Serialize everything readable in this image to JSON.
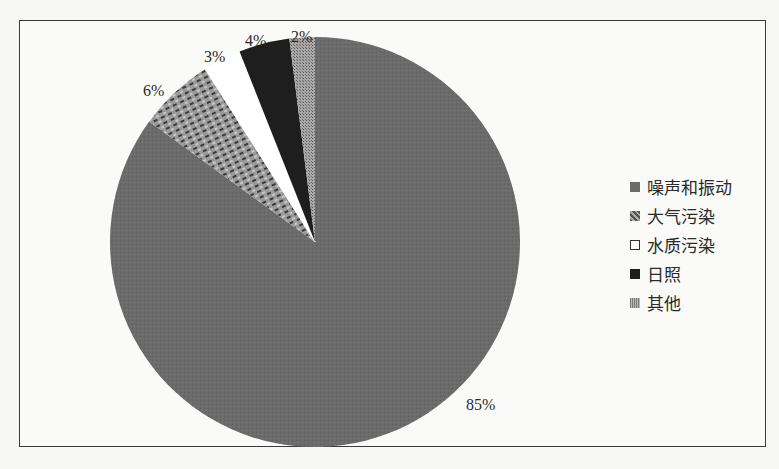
{
  "chart_data": {
    "type": "pie",
    "title": "",
    "categories": [
      "噪声和振动",
      "大气污染",
      "水质污染",
      "日照",
      "其他"
    ],
    "values": [
      85,
      6,
      3,
      4,
      2
    ],
    "labels": [
      "85%",
      "6%",
      "3%",
      "4%",
      "2%"
    ],
    "colors": [
      "#6b6b6b",
      "#8a8a8a",
      "#ffffff",
      "#1e1e1e",
      "#9a9a9a"
    ],
    "legend_position": "right",
    "start_angle_deg": 0,
    "direction": "clockwise"
  },
  "legend": {
    "items": [
      {
        "label": "噪声和振动"
      },
      {
        "label": "大气污染"
      },
      {
        "label": "水质污染"
      },
      {
        "label": "日照"
      },
      {
        "label": "其他"
      }
    ]
  },
  "slice_labels": {
    "noise": "85%",
    "air": "6%",
    "water": "3%",
    "sunlight": "4%",
    "other": "2%"
  }
}
